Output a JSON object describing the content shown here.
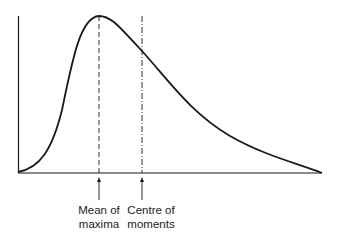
{
  "diagram": {
    "type": "skewed distribution curve",
    "colors": {
      "line": "#1a1a1a",
      "background": "#ffffff"
    },
    "markers": [
      {
        "id": "mean-of-maxima",
        "line1": "Mean of",
        "line2": "maxima",
        "x": 99
      },
      {
        "id": "centre-of-moments",
        "line1": "Centre of",
        "line2": "moments",
        "x": 142
      }
    ]
  }
}
